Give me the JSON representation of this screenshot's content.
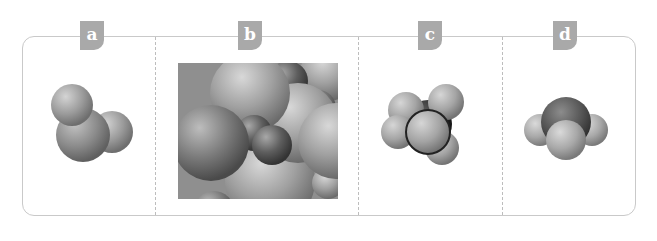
{
  "figure": {
    "panels": [
      {
        "label": "a",
        "model": "bent-triatomic-space-filling-model"
      },
      {
        "label": "b",
        "model": "packed-spheres-lattice-model"
      },
      {
        "label": "c",
        "model": "tetrahedral-space-filling-model"
      },
      {
        "label": "d",
        "model": "trigonal-pyramidal-space-filling-model"
      }
    ]
  },
  "colors": {
    "frame_border": "#c9c9c9",
    "divider": "#bdbdbd",
    "tab_background": "#a9a9a9",
    "tab_text": "#ffffff"
  }
}
